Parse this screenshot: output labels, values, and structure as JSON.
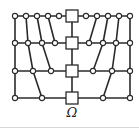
{
  "diagram": {
    "label": "Ω",
    "colors": {
      "stroke": "#2a2a2a",
      "fill": "#ffffff",
      "background": "#ffffff"
    },
    "rows": [
      {
        "y": 16,
        "circles": [
          15,
          26,
          37,
          48,
          59,
          86,
          97,
          108,
          119,
          130
        ],
        "square_x": 72
      },
      {
        "y": 43,
        "circles": [
          15,
          28,
          42,
          55,
          89,
          103,
          116,
          130
        ],
        "square_x": 72
      },
      {
        "y": 71,
        "circles": [
          15,
          33,
          51,
          93,
          112,
          130
        ],
        "square_x": 72
      },
      {
        "y": 98,
        "circles": [
          15,
          42,
          103,
          130
        ],
        "square_x": 72
      }
    ],
    "vertical_edges": [
      [
        [
          15,
          16
        ],
        [
          15,
          43
        ]
      ],
      [
        [
          26,
          16
        ],
        [
          28,
          43
        ]
      ],
      [
        [
          37,
          16
        ],
        [
          42,
          43
        ]
      ],
      [
        [
          48,
          16
        ],
        [
          55,
          43
        ]
      ],
      [
        [
          130,
          16
        ],
        [
          130,
          43
        ]
      ],
      [
        [
          119,
          16
        ],
        [
          116,
          43
        ]
      ],
      [
        [
          108,
          16
        ],
        [
          103,
          43
        ]
      ],
      [
        [
          97,
          16
        ],
        [
          89,
          43
        ]
      ],
      [
        [
          15,
          43
        ],
        [
          15,
          71
        ]
      ],
      [
        [
          28,
          43
        ],
        [
          33,
          71
        ]
      ],
      [
        [
          42,
          43
        ],
        [
          51,
          71
        ]
      ],
      [
        [
          130,
          43
        ],
        [
          130,
          71
        ]
      ],
      [
        [
          116,
          43
        ],
        [
          112,
          71
        ]
      ],
      [
        [
          103,
          43
        ],
        [
          93,
          71
        ]
      ],
      [
        [
          15,
          71
        ],
        [
          15,
          98
        ]
      ],
      [
        [
          33,
          71
        ],
        [
          42,
          98
        ]
      ],
      [
        [
          130,
          71
        ],
        [
          130,
          98
        ]
      ],
      [
        [
          112,
          71
        ],
        [
          103,
          98
        ]
      ],
      [
        [
          72,
          16
        ],
        [
          72,
          98
        ]
      ]
    ]
  }
}
